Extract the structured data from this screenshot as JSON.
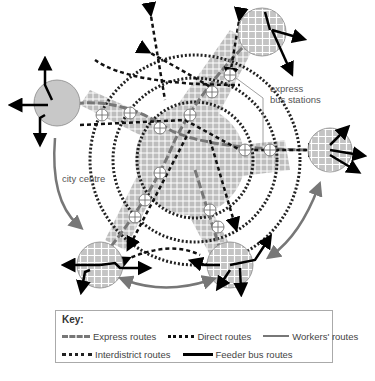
{
  "diagram": {
    "labels": {
      "express_bus_stations": "express\nbus stations",
      "city_centre": "city centre"
    },
    "colors": {
      "town_fill": "#c8c8c8",
      "urban_fill": "#bdbdbd",
      "express": "#777777",
      "direct": "#111111",
      "workers": "#777777",
      "interdistrict": "#222222",
      "feeder": "#000000"
    }
  },
  "key": {
    "title": "Key:",
    "items": [
      {
        "label": "Express routes",
        "style": "long-dash-grey"
      },
      {
        "label": "Direct routes",
        "style": "short-dash-black"
      },
      {
        "label": "Workers' routes",
        "style": "solid-grey"
      },
      {
        "label": "Interdistrict routes",
        "style": "dotted-black"
      },
      {
        "label": "Feeder bus routes",
        "style": "solid-black"
      }
    ]
  }
}
